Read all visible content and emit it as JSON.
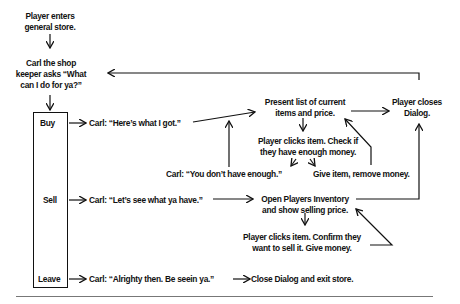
{
  "diagram": {
    "type": "flowchart",
    "nodes": {
      "enter": "Player enters\ngeneral store.",
      "ask": "Carl the shop\nkeeper asks “What\ncan I do for ya?”",
      "menu_buy": "Buy",
      "menu_sell": "Sell",
      "menu_leave": "Leave",
      "buy_say": "Carl: “Here’s what I got.”",
      "present_list": "Present list of current\nitems and price.",
      "close_dialog": "Player closes\nDialog.",
      "buy_click": "Player clicks item. Check if\nthey have enough money.",
      "not_enough": "Carl: “You don’t have enough.”",
      "give_item": "Give item, remove money.",
      "sell_say": "Carl: “Let’s see what ya have.”",
      "open_inventory": "Open Players Inventory\nand show selling price.",
      "sell_click": "Player clicks item. Confirm they\nwant to sell it. Give money.",
      "leave_say": "Carl: “Alrighty then. Be seein ya.”",
      "exit": "Close Dialog and exit store."
    },
    "edges": [
      [
        "enter",
        "ask"
      ],
      [
        "ask",
        "menu"
      ],
      [
        "menu_buy",
        "buy_say"
      ],
      [
        "buy_say",
        "present_list"
      ],
      [
        "present_list",
        "close_dialog"
      ],
      [
        "present_list",
        "buy_click"
      ],
      [
        "buy_click",
        "not_enough"
      ],
      [
        "buy_click",
        "give_item"
      ],
      [
        "not_enough",
        "present_list"
      ],
      [
        "give_item",
        "present_list"
      ],
      [
        "close_dialog",
        "ask"
      ],
      [
        "menu_sell",
        "sell_say"
      ],
      [
        "sell_say",
        "open_inventory"
      ],
      [
        "open_inventory",
        "close_dialog"
      ],
      [
        "open_inventory",
        "sell_click"
      ],
      [
        "sell_click",
        "open_inventory"
      ],
      [
        "menu_leave",
        "leave_say"
      ],
      [
        "leave_say",
        "exit"
      ]
    ]
  }
}
